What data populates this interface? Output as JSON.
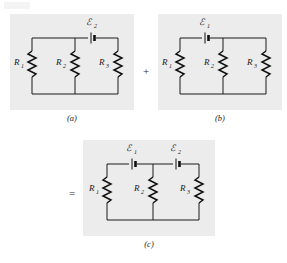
{
  "figure": {
    "type": "circuit-diagram",
    "operators": {
      "plus": "+",
      "equals": "="
    },
    "panels": [
      {
        "id": "a",
        "caption": "(a)",
        "resistors": [
          {
            "label": "R",
            "subscript": "1",
            "branch": "left"
          },
          {
            "label": "R",
            "subscript": "2",
            "branch": "middle"
          },
          {
            "label": "R",
            "subscript": "3",
            "branch": "right"
          }
        ],
        "emfs": [
          {
            "label": "ℰ",
            "subscript": "2",
            "position": "top-right-segment"
          }
        ]
      },
      {
        "id": "b",
        "caption": "(b)",
        "resistors": [
          {
            "label": "R",
            "subscript": "1",
            "branch": "left"
          },
          {
            "label": "R",
            "subscript": "2",
            "branch": "middle"
          },
          {
            "label": "R",
            "subscript": "3",
            "branch": "right"
          }
        ],
        "emfs": [
          {
            "label": "ℰ",
            "subscript": "1",
            "position": "top-left-segment"
          }
        ]
      },
      {
        "id": "c",
        "caption": "(c)",
        "resistors": [
          {
            "label": "R",
            "subscript": "1",
            "branch": "left"
          },
          {
            "label": "R",
            "subscript": "2",
            "branch": "middle"
          },
          {
            "label": "R",
            "subscript": "3",
            "branch": "right"
          }
        ],
        "emfs": [
          {
            "label": "ℰ",
            "subscript": "1",
            "position": "top-left-segment"
          },
          {
            "label": "ℰ",
            "subscript": "2",
            "position": "top-right-segment"
          }
        ]
      }
    ]
  },
  "colors": {
    "page_background": "#ffffff",
    "panel_background": "#ececed",
    "ink": "#1a1a1a"
  }
}
